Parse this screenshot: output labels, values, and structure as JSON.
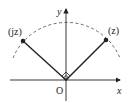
{
  "diagram": {
    "type": "complex-plane-rotation",
    "axes": {
      "x_label": "x",
      "y_label": "y",
      "origin_label": "O"
    },
    "points": [
      {
        "label": "(jz)",
        "name": "jz"
      },
      {
        "label": "(z)",
        "name": "z"
      }
    ],
    "arc_style": "dashed",
    "right_angle_marker": true,
    "colors": {
      "line": "#222222",
      "arc": "#444444",
      "background": "#ffffff"
    }
  }
}
